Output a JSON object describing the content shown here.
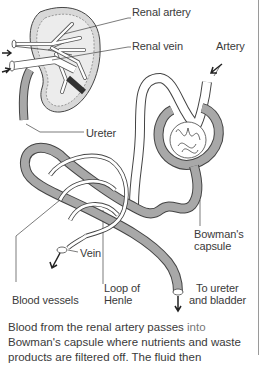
{
  "labels": {
    "renal_artery": "Renal artery",
    "renal_vein": "Renal vein",
    "artery": "Artery",
    "ureter": "Ureter",
    "bowmans_capsule_1": "Bowman's",
    "bowmans_capsule_2": "capsule",
    "vein": "Vein",
    "loop_of_henle_1": "Loop of",
    "loop_of_henle_2": "Henle",
    "to_ureter_1": "To ureter",
    "to_ureter_2": "and bladder",
    "blood_vessels": "Blood vessels"
  },
  "caption": {
    "line1_a": "Blood from the renal artery passes ",
    "line1_b": "into",
    "line2": "Bowman's capsule where nutrients and waste",
    "line3": "products are filtered off. The fluid then"
  },
  "colors": {
    "tube_fill": "#a8a8a8",
    "outline": "#444444",
    "text": "#3a3a3a"
  }
}
